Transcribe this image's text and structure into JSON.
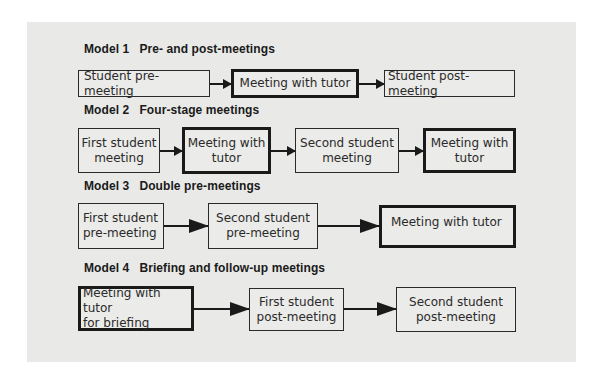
{
  "models": [
    {
      "number": "Model 1",
      "title": "Pre- and post-meetings",
      "boxes": [
        {
          "label": "Student pre-meeting",
          "emphasis": false
        },
        {
          "label": "Meeting with tutor",
          "emphasis": true
        },
        {
          "label": "Student post-meeting",
          "emphasis": false
        }
      ]
    },
    {
      "number": "Model 2",
      "title": "Four-stage meetings",
      "boxes": [
        {
          "label": "First student\nmeeting",
          "emphasis": false
        },
        {
          "label": "Meeting with\ntutor",
          "emphasis": true
        },
        {
          "label": "Second student\nmeeting",
          "emphasis": false
        },
        {
          "label": "Meeting with\ntutor",
          "emphasis": true
        }
      ]
    },
    {
      "number": "Model 3",
      "title": "Double pre-meetings",
      "boxes": [
        {
          "label": "First student\npre-meeting",
          "emphasis": false
        },
        {
          "label": "Second student\npre-meeting",
          "emphasis": false
        },
        {
          "label": "Meeting with tutor",
          "emphasis": true
        }
      ]
    },
    {
      "number": "Model 4",
      "title": "Briefing and follow-up meetings",
      "boxes": [
        {
          "label": "Meeting with tutor\nfor briefing",
          "emphasis": true
        },
        {
          "label": "First student\npost-meeting",
          "emphasis": false
        },
        {
          "label": "Second student\npost-meeting",
          "emphasis": false
        }
      ]
    }
  ],
  "colors": {
    "panel_background": "#e9e9e7",
    "box_border": "#1a1a1a",
    "text": "#2a2a2a"
  }
}
